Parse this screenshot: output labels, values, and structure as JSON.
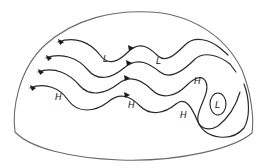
{
  "diagram": {
    "title": "",
    "colors": {
      "line": "#2a2a2a",
      "outline": "#6a6a6a",
      "background": "#ffffff"
    },
    "labels": [
      {
        "id": "low-1",
        "text": "L"
      },
      {
        "id": "low-2",
        "text": "L"
      },
      {
        "id": "high-1",
        "text": "H"
      },
      {
        "id": "high-2",
        "text": "H"
      },
      {
        "id": "high-3",
        "text": "H"
      },
      {
        "id": "high-4",
        "text": "H"
      },
      {
        "id": "cutoff-low",
        "text": "L"
      }
    ],
    "flow_lines": [
      {
        "id": "stream-1",
        "direction": "west-to-east"
      },
      {
        "id": "stream-2",
        "direction": "west-to-east"
      },
      {
        "id": "stream-3",
        "direction": "west-to-east"
      },
      {
        "id": "stream-4",
        "direction": "west-to-east"
      }
    ]
  }
}
